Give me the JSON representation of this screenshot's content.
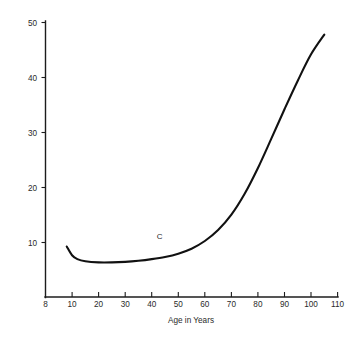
{
  "chart_data": {
    "type": "line",
    "title": "",
    "subtitle": "",
    "xlabel": "Age in Years",
    "ylabel": "",
    "xlim": [
      0,
      110
    ],
    "ylim": [
      0,
      50
    ],
    "grid": false,
    "legend": null,
    "x_ticks": [
      "8",
      "10",
      "20",
      "30",
      "40",
      "50",
      "60",
      "70",
      "80",
      "90",
      "100",
      "110"
    ],
    "x_tick_values": [
      0,
      10,
      20,
      30,
      40,
      50,
      60,
      70,
      80,
      90,
      100,
      110
    ],
    "y_ticks": [
      "10",
      "20",
      "30",
      "40",
      "50"
    ],
    "y_tick_values": [
      10,
      20,
      30,
      40,
      50
    ],
    "annotations": [
      {
        "text": "C",
        "x": 43,
        "y": 10.5
      }
    ],
    "series": [
      {
        "name": "C",
        "x": [
          8,
          10,
          12,
          15,
          20,
          25,
          30,
          35,
          40,
          45,
          50,
          55,
          60,
          65,
          70,
          75,
          80,
          85,
          90,
          95,
          100,
          105
        ],
        "values": [
          9.2,
          7.6,
          6.9,
          6.5,
          6.3,
          6.3,
          6.4,
          6.6,
          6.9,
          7.3,
          7.9,
          8.8,
          10.2,
          12.2,
          15.0,
          18.8,
          23.5,
          28.8,
          34.2,
          39.4,
          44.2,
          47.8
        ]
      }
    ]
  },
  "axis_titles": {
    "x": "Age in Years"
  }
}
